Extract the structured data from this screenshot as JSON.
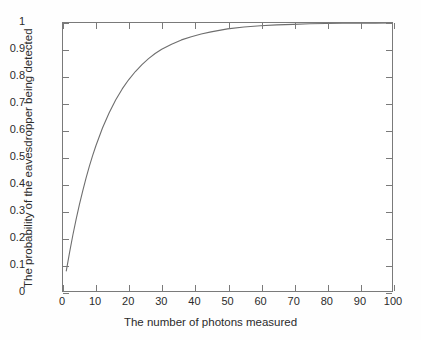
{
  "chart_data": {
    "type": "line",
    "title": "",
    "xlabel": "The number of photons measured",
    "ylabel": "The probability of the eavesdropper being detected",
    "xlim": [
      0,
      100
    ],
    "ylim": [
      0,
      1
    ],
    "grid": false,
    "legend": null,
    "xticks": [
      "0",
      "10",
      "20",
      "30",
      "40",
      "50",
      "60",
      "70",
      "80",
      "90",
      "100"
    ],
    "xtick_values": [
      0,
      10,
      20,
      30,
      40,
      50,
      60,
      70,
      80,
      90,
      100
    ],
    "yticks": [
      "0",
      "0.1",
      "0.2",
      "0.3",
      "0.4",
      "0.5",
      "0.6",
      "0.7",
      "0.8",
      "0.9",
      "1"
    ],
    "ytick_values": [
      0,
      0.1,
      0.2,
      0.3,
      0.4,
      0.5,
      0.6,
      0.7,
      0.8,
      0.9,
      1
    ],
    "series": [
      {
        "name": "probability of detection",
        "color": "#6e6e6e",
        "x": [
          1,
          2,
          3,
          4,
          5,
          6,
          7,
          8,
          9,
          10,
          12,
          14,
          16,
          18,
          20,
          22,
          24,
          26,
          28,
          30,
          33,
          36,
          39,
          42,
          45,
          50,
          55,
          60,
          65,
          70,
          75,
          80,
          85,
          90,
          95,
          100
        ],
        "values": [
          0.075,
          0.144,
          0.209,
          0.268,
          0.323,
          0.374,
          0.421,
          0.465,
          0.505,
          0.542,
          0.608,
          0.664,
          0.713,
          0.754,
          0.789,
          0.819,
          0.845,
          0.867,
          0.886,
          0.902,
          0.921,
          0.937,
          0.949,
          0.959,
          0.967,
          0.978,
          0.985,
          0.99,
          0.993,
          0.995,
          0.997,
          0.998,
          0.999,
          0.999,
          0.999,
          1.0
        ]
      }
    ]
  },
  "axis": {
    "x_title": "The number of photons measured",
    "y_title": "The probability of the eavesdropper being detected"
  }
}
